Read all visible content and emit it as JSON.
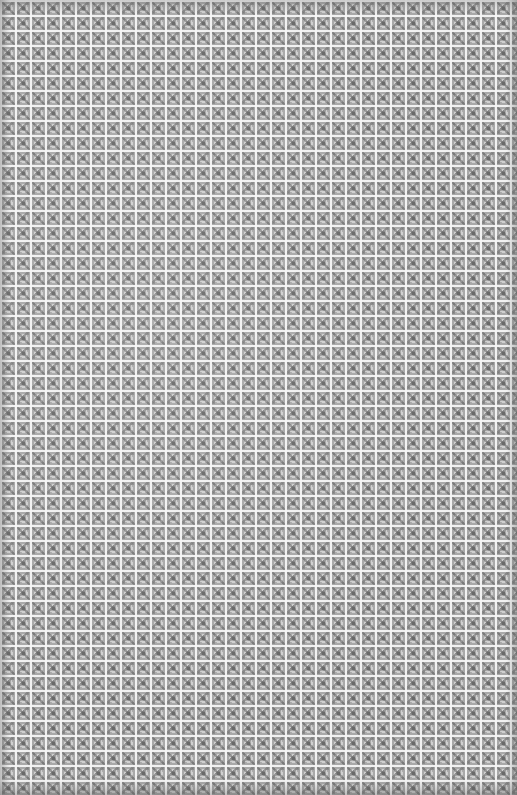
{
  "image": {
    "description": "Repeating grey lattice/grate tile texture with white grid lines and dark diamond motifs",
    "tile_size_px": 15,
    "colors": {
      "grid_lines": "#f5f5f5",
      "tile_base": "#a9a9a9",
      "motif_dark": "#6a6a6a"
    }
  }
}
